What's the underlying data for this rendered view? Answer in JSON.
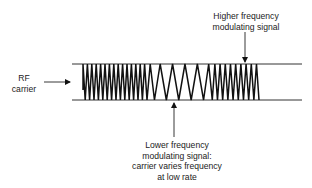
{
  "figure": {
    "type": "frequency-modulation-diagram",
    "labels": {
      "higher_frequency": [
        "Higher frequency",
        "modulating signal"
      ],
      "rf_carrier": [
        "RF",
        "carrier"
      ],
      "lower_frequency": [
        "Lower frequency",
        "modulating signal:",
        "carrier varies frequency",
        "at low rate"
      ]
    },
    "colors": {
      "ink": "#111111",
      "background": "#ffffff",
      "rule": "#333333"
    },
    "waveform": {
      "x_start": 83,
      "x_end": 259,
      "y_top": 64,
      "y_bottom": 100,
      "regions": [
        {
          "name": "dense-left",
          "x_start": 83,
          "x_end": 150,
          "half_period": 2.2
        },
        {
          "name": "sparse-middle",
          "x_start": 150,
          "x_end": 206,
          "half_period": 6.2
        },
        {
          "name": "dense-right",
          "x_start": 206,
          "x_end": 259,
          "half_period": 2.6
        }
      ]
    },
    "boundary_lines": {
      "x_start": 72,
      "x_end": 302,
      "top_y": 64,
      "bottom_y": 100
    },
    "arrows": [
      {
        "name": "higher-frequency-arrow",
        "x1": 245,
        "y1": 32,
        "x2": 245,
        "y2": 62
      },
      {
        "name": "rf-carrier-arrow",
        "x1": 44,
        "y1": 82,
        "x2": 70,
        "y2": 82
      },
      {
        "name": "lower-frequency-arrow",
        "x1": 174,
        "y1": 137,
        "x2": 174,
        "y2": 103
      }
    ]
  }
}
